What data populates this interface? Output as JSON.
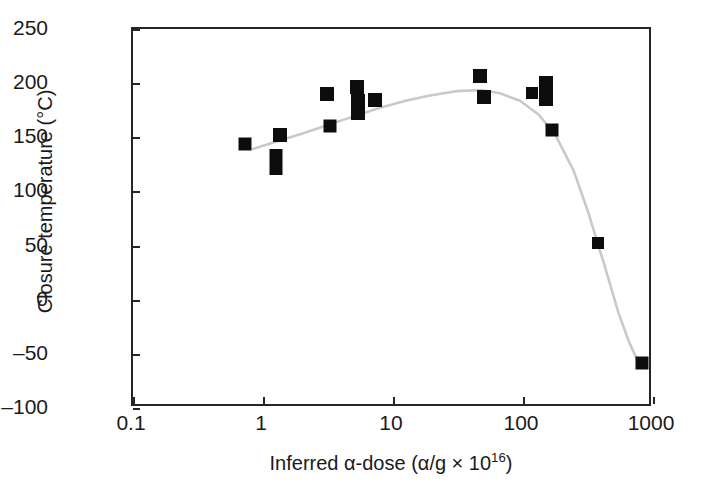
{
  "figure": {
    "background_color": "#ffffff",
    "axis_color": "#262626",
    "marker_color": "#0d0d0d",
    "fit_curve_color": "#c9c9c9"
  },
  "axis_titles": {
    "x_prefix": "Inferred α-dose (α/g × 10",
    "x_exponent": "16",
    "x_suffix": ")",
    "y": "Closure temperature (°C)"
  },
  "chart_data": {
    "type": "scatter",
    "title": "",
    "xlabel": "Inferred α-dose (α/g × 10^16)",
    "ylabel": "Closure temperature (°C)",
    "xscale": "log",
    "yscale": "linear",
    "xlim": [
      0.1,
      1000
    ],
    "ylim": [
      -100,
      250
    ],
    "grid": false,
    "legend": null,
    "xticks": [
      0.1,
      1,
      10,
      100,
      1000
    ],
    "xtick_labels": [
      "0.1",
      "1",
      "10",
      "100",
      "1000"
    ],
    "yticks": [
      -100,
      -50,
      0,
      50,
      100,
      150,
      200,
      250
    ],
    "ytick_labels": [
      "–100",
      "–50",
      "0",
      "50",
      "100",
      "150",
      "200",
      "250"
    ],
    "series": [
      {
        "name": "Closure temperature samples",
        "marker": "square",
        "color": "#0d0d0d",
        "points": [
          {
            "x": 0.73,
            "y": 144,
            "w": 13,
            "h": 13
          },
          {
            "x": 1.25,
            "y": 127,
            "w": 13,
            "h": 26
          },
          {
            "x": 1.35,
            "y": 152,
            "w": 14,
            "h": 14
          },
          {
            "x": 3.1,
            "y": 190,
            "w": 14,
            "h": 14
          },
          {
            "x": 3.3,
            "y": 160,
            "w": 13,
            "h": 13
          },
          {
            "x": 5.3,
            "y": 196,
            "w": 14,
            "h": 14
          },
          {
            "x": 5.4,
            "y": 178,
            "w": 14,
            "h": 26
          },
          {
            "x": 7.3,
            "y": 184,
            "w": 14,
            "h": 14
          },
          {
            "x": 47,
            "y": 207,
            "w": 14,
            "h": 14
          },
          {
            "x": 50,
            "y": 187,
            "w": 14,
            "h": 14
          },
          {
            "x": 118,
            "y": 191,
            "w": 12,
            "h": 12
          },
          {
            "x": 150,
            "y": 193,
            "w": 14,
            "h": 30
          },
          {
            "x": 168,
            "y": 157,
            "w": 13,
            "h": 13
          },
          {
            "x": 380,
            "y": 52,
            "w": 12,
            "h": 12
          },
          {
            "x": 830,
            "y": -58,
            "w": 13,
            "h": 13
          }
        ]
      }
    ],
    "fit_curve": {
      "name": "fitted trend",
      "color": "#c9c9c9",
      "points": [
        {
          "x": 0.85,
          "y": 138
        },
        {
          "x": 1.3,
          "y": 145
        },
        {
          "x": 2.0,
          "y": 152
        },
        {
          "x": 3.0,
          "y": 159
        },
        {
          "x": 5.0,
          "y": 168
        },
        {
          "x": 8.0,
          "y": 176
        },
        {
          "x": 13.0,
          "y": 183
        },
        {
          "x": 20.0,
          "y": 188
        },
        {
          "x": 32.0,
          "y": 192
        },
        {
          "x": 50.0,
          "y": 193
        },
        {
          "x": 70.0,
          "y": 190
        },
        {
          "x": 100.0,
          "y": 183
        },
        {
          "x": 140.0,
          "y": 170
        },
        {
          "x": 190.0,
          "y": 150
        },
        {
          "x": 260.0,
          "y": 118
        },
        {
          "x": 340.0,
          "y": 78
        },
        {
          "x": 450.0,
          "y": 30
        },
        {
          "x": 580.0,
          "y": -15
        },
        {
          "x": 700.0,
          "y": -42
        },
        {
          "x": 820.0,
          "y": -60
        }
      ]
    }
  }
}
